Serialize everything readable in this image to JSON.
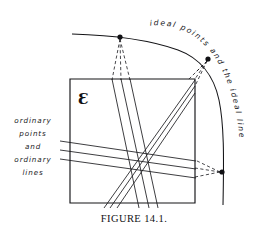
{
  "figure": {
    "caption": "FIGURE 14.1.",
    "plane_symbol": "Ɛ",
    "labels": {
      "left_label_lines": [
        "ordinary",
        "points",
        "and",
        "ordinary",
        "lines"
      ],
      "curve_label": "ideal points and the ideal line"
    },
    "colors": {
      "background": "#ffffff",
      "ink": "#141417",
      "line": "#1b1b1f",
      "point": "#111114",
      "caption": "#121214"
    },
    "geometry": {
      "box": {
        "x": 70,
        "y": 79,
        "width": 125,
        "height": 124
      },
      "ideal_points": [
        {
          "name": "top-left-ideal-point",
          "x": 120,
          "y": 37,
          "radius": 2.6
        },
        {
          "name": "upper-right-ideal-point",
          "x": 208,
          "y": 59,
          "radius": 2.6
        },
        {
          "name": "lower-right-ideal-point",
          "x": 241,
          "y": 172,
          "radius": 2.6
        }
      ],
      "ideal_line": "flat at left, bending down to the right and descending nearly vertically",
      "line_families": [
        {
          "name": "family-to-top-left-point",
          "count": 3,
          "style": "solid inside box, dashed outside"
        },
        {
          "name": "family-to-upper-right-point",
          "count": 3,
          "style": "solid inside box, dashed outside"
        },
        {
          "name": "family-to-lower-right-point",
          "count": 3,
          "style": "solid inside box, dashed outside"
        }
      ]
    }
  }
}
